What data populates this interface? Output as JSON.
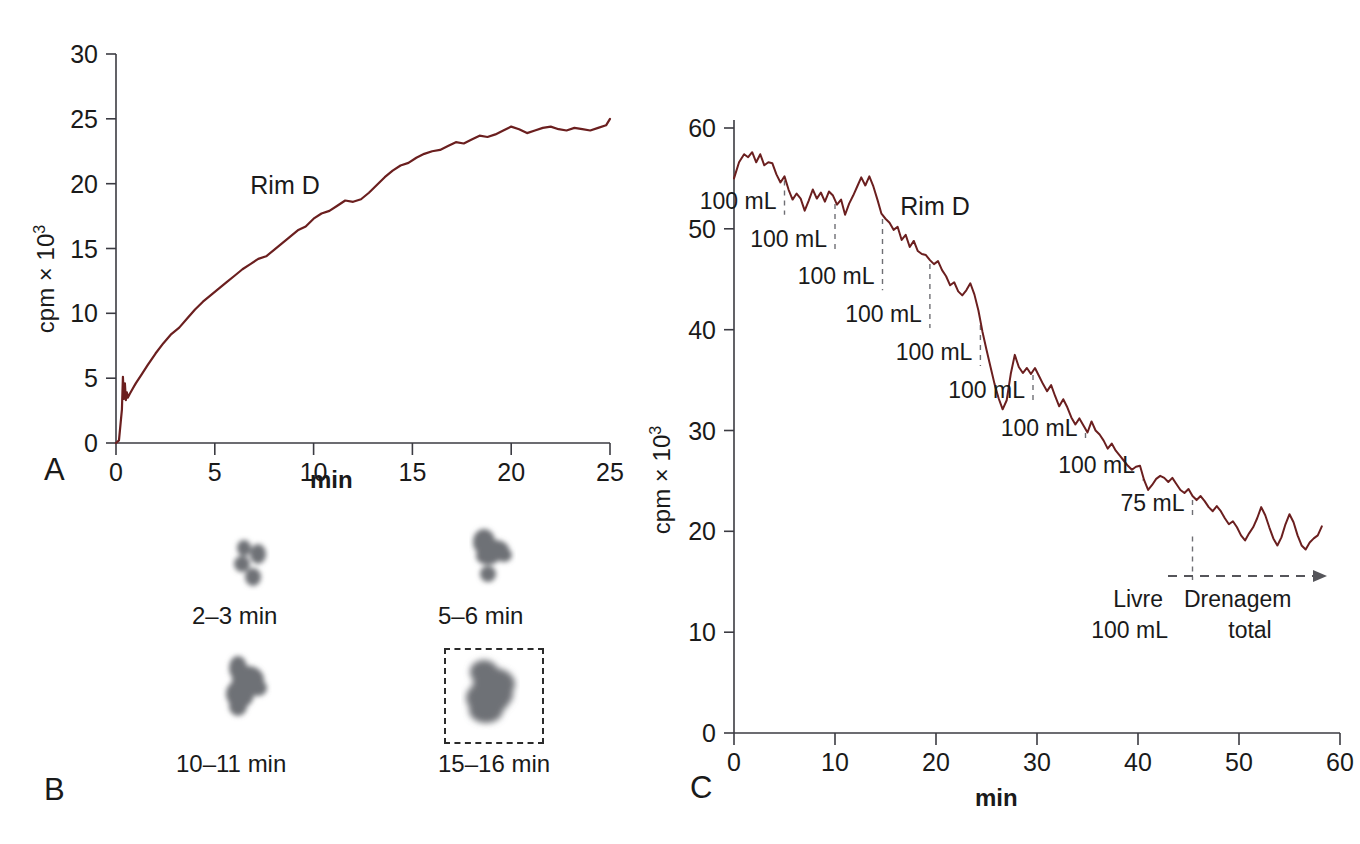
{
  "figure": {
    "panels": [
      "A",
      "B",
      "C"
    ],
    "curve_color": "#6b1f1f",
    "axis_color": "#3b3b42",
    "dash_color": "#6f6f74"
  },
  "panelA": {
    "label": "A",
    "series_label": "Rim D",
    "ylabel_main": "cpm × 10",
    "ylabel_exp": "3",
    "xlabel": "min",
    "yticks": [
      "0",
      "5",
      "10",
      "15",
      "20",
      "25",
      "30"
    ],
    "xticks": [
      "0",
      "5",
      "10",
      "15",
      "20",
      "25"
    ],
    "chart_data": {
      "type": "line",
      "title": "",
      "xlabel": "min",
      "ylabel": "cpm × 10^3",
      "xlim": [
        0,
        25
      ],
      "ylim": [
        0,
        30
      ],
      "grid": false,
      "legend": "none",
      "series": [
        {
          "name": "Rim D",
          "x": [
            0.0,
            0.15,
            0.3,
            0.35,
            0.4,
            0.45,
            0.5,
            0.55,
            0.6,
            0.7,
            0.85,
            1.0,
            1.3,
            1.6,
            2.0,
            2.4,
            2.8,
            3.2,
            3.6,
            4.0,
            4.4,
            4.8,
            5.2,
            5.6,
            6.0,
            6.4,
            6.8,
            7.2,
            7.6,
            8.0,
            8.4,
            8.8,
            9.2,
            9.6,
            10.0,
            10.4,
            10.8,
            11.2,
            11.6,
            12.0,
            12.4,
            12.8,
            13.2,
            13.6,
            14.0,
            14.4,
            14.8,
            15.2,
            15.6,
            16.0,
            16.4,
            16.8,
            17.2,
            17.6,
            18.0,
            18.4,
            18.8,
            19.2,
            19.6,
            20.0,
            20.4,
            20.8,
            21.2,
            21.6,
            22.0,
            22.4,
            22.8,
            23.2,
            23.6,
            24.0,
            24.4,
            24.8,
            25.0
          ],
          "y": [
            0.0,
            0.2,
            2.6,
            5.1,
            3.4,
            4.6,
            3.3,
            3.9,
            3.5,
            3.8,
            4.2,
            4.6,
            5.3,
            6.0,
            6.9,
            7.7,
            8.4,
            8.9,
            9.6,
            10.3,
            10.9,
            11.4,
            11.9,
            12.4,
            12.9,
            13.4,
            13.8,
            14.2,
            14.4,
            14.9,
            15.4,
            15.9,
            16.4,
            16.7,
            17.3,
            17.7,
            17.9,
            18.3,
            18.7,
            18.6,
            18.8,
            19.3,
            19.9,
            20.5,
            21.0,
            21.4,
            21.6,
            22.0,
            22.3,
            22.5,
            22.6,
            22.9,
            23.2,
            23.1,
            23.4,
            23.7,
            23.6,
            23.8,
            24.1,
            24.4,
            24.2,
            23.9,
            24.1,
            24.3,
            24.4,
            24.2,
            24.1,
            24.3,
            24.2,
            24.1,
            24.3,
            24.5,
            25.0
          ]
        }
      ]
    }
  },
  "panelB": {
    "label": "B",
    "frames": [
      {
        "caption": "2–3 min"
      },
      {
        "caption": "5–6 min"
      },
      {
        "caption": "10–11 min"
      },
      {
        "caption": "15–16 min",
        "roi": true
      }
    ]
  },
  "panelC": {
    "label": "C",
    "series_label": "Rim D",
    "ylabel_main": "cpm × 10",
    "ylabel_exp": "3",
    "xlabel": "min",
    "yticks": [
      "0",
      "10",
      "20",
      "30",
      "40",
      "50",
      "60"
    ],
    "xticks": [
      "0",
      "10",
      "20",
      "30",
      "40",
      "50",
      "60"
    ],
    "annotations": [
      {
        "text": "100 mL",
        "at_min": 5.0
      },
      {
        "text": "100 mL",
        "at_min": 10.0
      },
      {
        "text": "100 mL",
        "at_min": 14.7
      },
      {
        "text": "100 mL",
        "at_min": 19.4
      },
      {
        "text": "100 mL",
        "at_min": 24.4
      },
      {
        "text": "100 mL",
        "at_min": 29.6
      },
      {
        "text": "100 mL",
        "at_min": 34.8
      },
      {
        "text": "100 mL",
        "at_min": 40.5
      },
      {
        "text": "75 mL",
        "at_min": 45.4
      }
    ],
    "bottom_notes": {
      "free_line1": "Livre",
      "free_line2": "100 mL",
      "drain_line1": "Drenagem",
      "drain_line2": "total"
    },
    "chart_data": {
      "type": "line",
      "title": "",
      "xlabel": "min",
      "ylabel": "cpm × 10^3",
      "xlim": [
        0,
        60
      ],
      "ylim": [
        0,
        60
      ],
      "grid": false,
      "legend": "none",
      "series": [
        {
          "name": "Rim D",
          "x": [
            0.0,
            0.5,
            1.0,
            1.4,
            1.8,
            2.2,
            2.6,
            3.0,
            3.4,
            3.8,
            4.2,
            4.6,
            5.0,
            5.4,
            5.8,
            6.2,
            6.6,
            7.0,
            7.4,
            7.8,
            8.2,
            8.6,
            9.0,
            9.4,
            9.8,
            10.2,
            10.6,
            11.0,
            11.4,
            11.8,
            12.2,
            12.6,
            13.0,
            13.4,
            13.8,
            14.2,
            14.6,
            15.0,
            15.4,
            15.8,
            16.2,
            16.6,
            17.0,
            17.4,
            17.8,
            18.2,
            18.6,
            19.0,
            19.4,
            19.8,
            20.2,
            20.6,
            21.0,
            21.4,
            21.8,
            22.2,
            22.6,
            23.0,
            23.4,
            23.8,
            24.2,
            24.6,
            25.0,
            25.4,
            25.8,
            26.2,
            26.6,
            27.0,
            27.4,
            27.8,
            28.2,
            28.6,
            29.0,
            29.4,
            29.8,
            30.2,
            30.6,
            31.0,
            31.4,
            31.8,
            32.2,
            32.6,
            33.0,
            33.4,
            33.8,
            34.2,
            34.6,
            35.0,
            35.4,
            35.8,
            36.2,
            36.6,
            37.0,
            37.4,
            37.8,
            38.2,
            38.6,
            39.0,
            39.4,
            39.8,
            40.2,
            40.6,
            41.0,
            41.4,
            41.8,
            42.2,
            42.6,
            43.0,
            43.4,
            43.8,
            44.2,
            44.6,
            45.0,
            45.4,
            45.8,
            46.2,
            46.6,
            47.0,
            47.4,
            47.8,
            48.2,
            48.6,
            49.0,
            49.4,
            49.8,
            50.2,
            50.6,
            51.0,
            51.4,
            51.8,
            52.2,
            52.6,
            53.0,
            53.4,
            53.8,
            54.2,
            54.6,
            55.0,
            55.4,
            55.8,
            56.2,
            56.6,
            57.0,
            57.4,
            57.8,
            58.2,
            58.6,
            59.0,
            59.4,
            59.8
          ],
          "y": [
            55.0,
            56.6,
            57.4,
            57.1,
            57.6,
            56.6,
            57.4,
            56.3,
            56.6,
            56.5,
            55.4,
            54.6,
            55.2,
            53.9,
            52.9,
            53.5,
            53.0,
            51.8,
            52.8,
            53.9,
            53.0,
            53.6,
            52.7,
            53.7,
            53.3,
            52.4,
            52.9,
            51.4,
            52.5,
            53.3,
            54.2,
            55.1,
            54.3,
            55.2,
            54.2,
            52.9,
            51.5,
            51.0,
            50.6,
            49.9,
            50.2,
            48.9,
            49.4,
            48.2,
            48.8,
            47.8,
            47.5,
            47.4,
            46.9,
            46.5,
            46.8,
            45.9,
            45.3,
            44.4,
            44.7,
            43.8,
            43.4,
            43.9,
            44.6,
            43.5,
            41.9,
            39.8,
            38.0,
            36.3,
            34.6,
            33.2,
            32.1,
            33.0,
            35.6,
            37.5,
            36.3,
            35.7,
            36.2,
            35.6,
            36.2,
            35.4,
            34.6,
            33.9,
            34.5,
            33.4,
            32.4,
            33.1,
            32.3,
            31.3,
            30.6,
            31.2,
            30.5,
            29.8,
            30.9,
            30.0,
            29.6,
            29.0,
            28.2,
            28.7,
            28.0,
            27.5,
            27.0,
            26.5,
            26.1,
            26.4,
            26.5,
            25.1,
            24.1,
            24.6,
            25.2,
            25.5,
            25.3,
            24.9,
            25.3,
            24.7,
            24.1,
            23.8,
            24.2,
            23.5,
            23.1,
            23.5,
            23.0,
            22.4,
            22.0,
            22.5,
            22.0,
            21.3,
            20.7,
            21.0,
            20.4,
            19.6,
            19.1,
            19.8,
            20.4,
            21.3,
            22.4,
            21.6,
            20.4,
            19.3,
            18.6,
            19.4,
            20.7,
            21.7,
            20.9,
            19.6,
            18.6,
            18.2,
            18.9,
            19.3,
            19.6,
            20.5
          ]
        }
      ]
    }
  }
}
